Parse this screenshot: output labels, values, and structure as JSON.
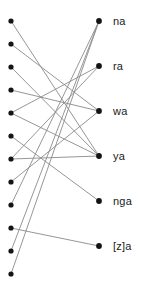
{
  "figure": {
    "type": "bipartite-graph",
    "background_color": "#ffffff",
    "node_color": "#141414",
    "edge_color": "#8a8a8a",
    "label_color": "#1a1a1a"
  },
  "left_column": {
    "x": 11,
    "node_radius": 2.6,
    "count": 12,
    "nodes": [
      {
        "id": "L1",
        "y": 21
      },
      {
        "id": "L2",
        "y": 44
      },
      {
        "id": "L3",
        "y": 67
      },
      {
        "id": "L4",
        "y": 90
      },
      {
        "id": "L5",
        "y": 113
      },
      {
        "id": "L6",
        "y": 136
      },
      {
        "id": "L7",
        "y": 159
      },
      {
        "id": "L8",
        "y": 182
      },
      {
        "id": "L9",
        "y": 205
      },
      {
        "id": "L10",
        "y": 228
      },
      {
        "id": "L11",
        "y": 251
      },
      {
        "id": "L12",
        "y": 274
      }
    ]
  },
  "right_column": {
    "x": 99,
    "label_x": 113,
    "node_radius": 2.9,
    "count": 6,
    "nodes": [
      {
        "id": "R1",
        "y": 21,
        "label": "na"
      },
      {
        "id": "R2",
        "y": 66,
        "label": "ra"
      },
      {
        "id": "R3",
        "y": 111,
        "label": "wa"
      },
      {
        "id": "R4",
        "y": 156,
        "label": "ya"
      },
      {
        "id": "R5",
        "y": 201,
        "label": "nga"
      },
      {
        "id": "R6",
        "y": 246,
        "label": "[z]a"
      }
    ]
  },
  "edges": [
    {
      "from": "L1",
      "to": "R4"
    },
    {
      "from": "L2",
      "to": "R3"
    },
    {
      "from": "L3",
      "to": "R4"
    },
    {
      "from": "L4",
      "to": "R3"
    },
    {
      "from": "L5",
      "to": "R2"
    },
    {
      "from": "L5",
      "to": "R4"
    },
    {
      "from": "L6",
      "to": "R5"
    },
    {
      "from": "L7",
      "to": "R4"
    },
    {
      "from": "L7",
      "to": "R2"
    },
    {
      "from": "L8",
      "to": "R3"
    },
    {
      "from": "L9",
      "to": "R1"
    },
    {
      "from": "L10",
      "to": "R6"
    },
    {
      "from": "L11",
      "to": "R1"
    },
    {
      "from": "L12",
      "to": "R1"
    }
  ]
}
